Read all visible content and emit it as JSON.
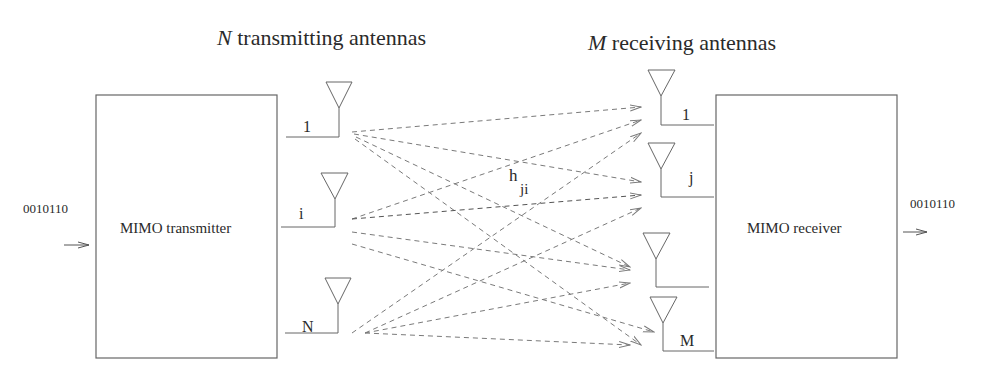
{
  "titles": {
    "tx_var": "N",
    "tx_rest": " transmitting antennas",
    "rx_var": "M",
    "rx_rest": " receiving antennas"
  },
  "transmitter": {
    "label": "MIMO transmitter",
    "input_bits": "0010110"
  },
  "receiver": {
    "label": "MIMO receiver",
    "output_bits": "0010110"
  },
  "tx_antennas": [
    {
      "label": "1"
    },
    {
      "label": "i"
    },
    {
      "label": "N"
    }
  ],
  "rx_antennas": [
    {
      "label": "1"
    },
    {
      "label": "j"
    },
    {
      "label": ""
    },
    {
      "label": "M"
    }
  ],
  "channel": {
    "label_main": "h",
    "label_sub": "ji"
  },
  "colors": {
    "line": "#555555",
    "dashed": "#7a7a7a",
    "text": "#2a2a2a"
  }
}
